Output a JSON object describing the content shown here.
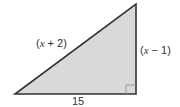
{
  "diagram": {
    "type": "right-triangle",
    "fill_color": "#d9d9d9",
    "stroke_color": "#333333",
    "vertices": {
      "bottom_left": [
        15,
        94
      ],
      "bottom_right": [
        136,
        94
      ],
      "top": [
        136,
        4
      ]
    },
    "right_angle_at": "bottom_right",
    "labels": {
      "hypotenuse": {
        "open": "(",
        "var": "x",
        "rest": " + 2)"
      },
      "vertical_leg": {
        "open": "(",
        "var": "x",
        "rest": " − 1)"
      },
      "base": "15"
    }
  }
}
